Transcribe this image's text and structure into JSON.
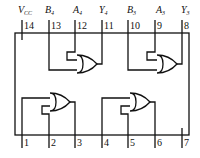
{
  "diagram": {
    "top_pins": [
      {
        "number": "14",
        "name": "V",
        "sub": "CC"
      },
      {
        "number": "13",
        "name": "B",
        "sub": "4"
      },
      {
        "number": "12",
        "name": "A",
        "sub": "4"
      },
      {
        "number": "11",
        "name": "Y",
        "sub": "4"
      },
      {
        "number": "10",
        "name": "B",
        "sub": "3"
      },
      {
        "number": "9",
        "name": "A",
        "sub": "3"
      },
      {
        "number": "8",
        "name": "Y",
        "sub": "3"
      }
    ],
    "bottom_pins": [
      {
        "number": "1"
      },
      {
        "number": "2"
      },
      {
        "number": "3"
      },
      {
        "number": "4"
      },
      {
        "number": "5"
      },
      {
        "number": "6"
      },
      {
        "number": "7"
      }
    ],
    "gates": [
      {
        "type": "OR",
        "inputs": [
          "13",
          "12"
        ],
        "output": "11"
      },
      {
        "type": "OR",
        "inputs": [
          "10",
          "9"
        ],
        "output": "8"
      },
      {
        "type": "OR",
        "inputs": [
          "1",
          "2"
        ],
        "output": "3"
      },
      {
        "type": "OR",
        "inputs": [
          "4",
          "5"
        ],
        "output": "6"
      }
    ],
    "colors": {
      "line": "#111111",
      "background": "#ffffff"
    }
  }
}
